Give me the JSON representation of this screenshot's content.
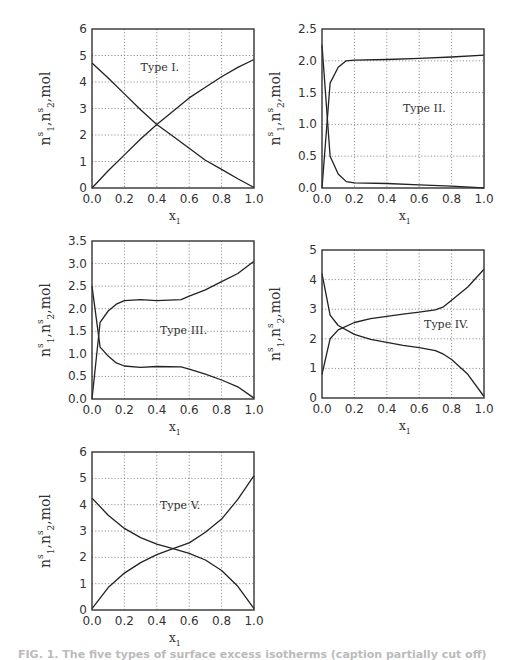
{
  "figure": {
    "caption": "FIG. 1. The five types of surface excess isotherms (caption partially cut off)"
  },
  "chart_data": [
    {
      "type": "line",
      "title": "Type I.",
      "annotation": "Type I.",
      "xlabel": "x1",
      "ylabel": "n1s, n2s, mol",
      "xlim": [
        0.0,
        1.0
      ],
      "ylim": [
        0,
        6
      ],
      "xticks": [
        "0.0",
        "0.2",
        "0.4",
        "0.6",
        "0.8",
        "1.0"
      ],
      "yticks": [
        "0",
        "1",
        "2",
        "3",
        "4",
        "5",
        "6"
      ],
      "grid": true,
      "frame": {
        "left": 92,
        "top": 29,
        "right": 254,
        "bottom": 188
      },
      "annot_pos": [
        0.3,
        4.4
      ],
      "series": [
        {
          "name": "n1s",
          "x": [
            0,
            0.1,
            0.2,
            0.3,
            0.4,
            0.5,
            0.6,
            0.7,
            0.8,
            0.9,
            1.0
          ],
          "values": [
            0,
            0.65,
            1.25,
            1.85,
            2.4,
            2.9,
            3.4,
            3.8,
            4.2,
            4.55,
            4.85
          ]
        },
        {
          "name": "n2s",
          "x": [
            0,
            0.1,
            0.2,
            0.3,
            0.4,
            0.5,
            0.6,
            0.7,
            0.8,
            0.9,
            1.0
          ],
          "values": [
            4.72,
            4.15,
            3.55,
            2.95,
            2.4,
            1.95,
            1.5,
            1.05,
            0.7,
            0.35,
            0.02
          ]
        }
      ]
    },
    {
      "type": "line",
      "title": "Type II.",
      "annotation": "Type II.",
      "xlabel": "x1",
      "ylabel": "n1s, n2s, mol",
      "xlim": [
        0.0,
        1.0
      ],
      "ylim": [
        0.0,
        2.5
      ],
      "xticks": [
        "0.0",
        "0.2",
        "0.4",
        "0.6",
        "0.8",
        "1.0"
      ],
      "yticks": [
        "0.0",
        "0.5",
        "1.0",
        "1.5",
        "2.0",
        "2.5"
      ],
      "grid": true,
      "frame": {
        "left": 322,
        "top": 29,
        "right": 484,
        "bottom": 188
      },
      "annot_pos": [
        0.5,
        1.2
      ],
      "series": [
        {
          "name": "n1s",
          "x": [
            0,
            0.05,
            0.1,
            0.15,
            0.2,
            0.4,
            0.6,
            0.8,
            1.0
          ],
          "values": [
            0.0,
            1.65,
            1.9,
            2.0,
            2.01,
            2.02,
            2.04,
            2.06,
            2.09
          ]
        },
        {
          "name": "n2s",
          "x": [
            0,
            0.05,
            0.1,
            0.15,
            0.2,
            0.4,
            0.6,
            0.8,
            1.0
          ],
          "values": [
            2.25,
            0.5,
            0.22,
            0.1,
            0.08,
            0.07,
            0.05,
            0.03,
            0.0
          ]
        }
      ]
    },
    {
      "type": "line",
      "title": "Type III.",
      "annotation": "Type III.",
      "xlabel": "x1",
      "ylabel": "n1s, n2s, mol",
      "xlim": [
        0.0,
        1.0
      ],
      "ylim": [
        0.0,
        3.5
      ],
      "xticks": [
        "0.0",
        "0.2",
        "0.4",
        "0.6",
        "0.8",
        "1.0"
      ],
      "yticks": [
        "0.0",
        "0.5",
        "1.0",
        "1.5",
        "2.0",
        "2.5",
        "3.0",
        "3.5"
      ],
      "grid": true,
      "frame": {
        "left": 92,
        "top": 241,
        "right": 254,
        "bottom": 399
      },
      "annot_pos": [
        0.42,
        1.45
      ],
      "series": [
        {
          "name": "n1s",
          "x": [
            0,
            0.05,
            0.1,
            0.15,
            0.2,
            0.3,
            0.4,
            0.55,
            0.6,
            0.7,
            0.8,
            0.9,
            1.0
          ],
          "values": [
            0.0,
            1.7,
            1.95,
            2.1,
            2.18,
            2.2,
            2.18,
            2.2,
            2.28,
            2.42,
            2.6,
            2.78,
            3.05
          ]
        },
        {
          "name": "n2s",
          "x": [
            0,
            0.05,
            0.1,
            0.15,
            0.2,
            0.3,
            0.4,
            0.55,
            0.6,
            0.7,
            0.8,
            0.9,
            1.0
          ],
          "values": [
            2.5,
            1.15,
            0.95,
            0.8,
            0.73,
            0.7,
            0.72,
            0.71,
            0.66,
            0.55,
            0.42,
            0.27,
            0.02
          ]
        }
      ]
    },
    {
      "type": "line",
      "title": "Type IV.",
      "annotation": "Type IV.",
      "xlabel": "x1",
      "ylabel": "n1s, n2s, mol",
      "xlim": [
        0.0,
        1.0
      ],
      "ylim": [
        0,
        5
      ],
      "xticks": [
        "0.0",
        "0.2",
        "0.4",
        "0.6",
        "0.8",
        "1.0"
      ],
      "yticks": [
        "0",
        "1",
        "2",
        "3",
        "4",
        "5"
      ],
      "grid": true,
      "frame": {
        "left": 322,
        "top": 250,
        "right": 484,
        "bottom": 398
      },
      "annot_pos": [
        0.63,
        2.38
      ],
      "series": [
        {
          "name": "n1s",
          "x": [
            0,
            0.05,
            0.1,
            0.2,
            0.3,
            0.4,
            0.5,
            0.6,
            0.7,
            0.75,
            0.8,
            0.9,
            1.0
          ],
          "values": [
            0.8,
            2.0,
            2.3,
            2.55,
            2.68,
            2.76,
            2.83,
            2.9,
            2.98,
            3.08,
            3.3,
            3.75,
            4.35
          ]
        },
        {
          "name": "n2s",
          "x": [
            0,
            0.05,
            0.1,
            0.2,
            0.3,
            0.4,
            0.5,
            0.6,
            0.7,
            0.75,
            0.8,
            0.9,
            1.0
          ],
          "values": [
            4.2,
            2.8,
            2.45,
            2.15,
            1.98,
            1.88,
            1.78,
            1.7,
            1.6,
            1.48,
            1.3,
            0.8,
            0.05
          ]
        }
      ]
    },
    {
      "type": "line",
      "title": "Type V.",
      "annotation": "Type V.",
      "xlabel": "x1",
      "ylabel": "n1s, n2s, mol",
      "xlim": [
        0.0,
        1.0
      ],
      "ylim": [
        0,
        6
      ],
      "xticks": [
        "0.0",
        "0.2",
        "0.4",
        "0.6",
        "0.8",
        "1.0"
      ],
      "yticks": [
        "0",
        "1",
        "2",
        "3",
        "4",
        "5",
        "6"
      ],
      "grid": true,
      "frame": {
        "left": 92,
        "top": 452,
        "right": 254,
        "bottom": 610
      },
      "annot_pos": [
        0.42,
        3.85
      ],
      "series": [
        {
          "name": "n1s",
          "x": [
            0,
            0.1,
            0.2,
            0.3,
            0.4,
            0.5,
            0.6,
            0.7,
            0.8,
            0.9,
            1.0
          ],
          "values": [
            0.05,
            0.85,
            1.4,
            1.8,
            2.1,
            2.33,
            2.55,
            2.95,
            3.45,
            4.2,
            5.1
          ]
        },
        {
          "name": "n2s",
          "x": [
            0,
            0.1,
            0.2,
            0.3,
            0.4,
            0.5,
            0.6,
            0.7,
            0.8,
            0.9,
            1.0
          ],
          "values": [
            4.25,
            3.6,
            3.1,
            2.75,
            2.5,
            2.33,
            2.15,
            1.9,
            1.5,
            0.9,
            0.05
          ]
        }
      ]
    }
  ]
}
